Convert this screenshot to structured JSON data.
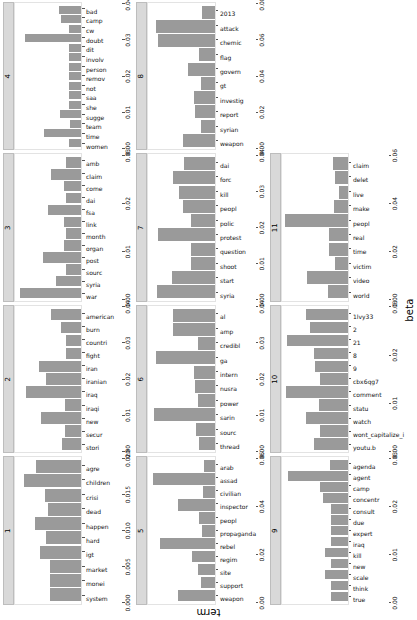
{
  "figure": {
    "xlabel": "beta",
    "ylabel": "term"
  },
  "chart_data": {
    "type": "bar",
    "title": "",
    "xlabel": "beta",
    "ylabel": "term",
    "grid": false,
    "legend": "none",
    "orientation": "horizontal",
    "note": "Faceted bar chart of LDA topic-model beta values; facets are topics 1-11 arranged in a 3-row x 4-column grid (last cell empty).",
    "facets": [
      {
        "topic": "1",
        "xlim": [
          0,
          0.02
        ],
        "ticks": [
          "0.000",
          "0.005",
          "0.010",
          "0.015",
          "0.020"
        ],
        "tick_values": [
          0.0,
          0.005,
          0.01,
          0.015,
          0.02
        ],
        "categories": [
          "system",
          "monei",
          "market",
          "igt",
          "hard",
          "happen",
          "dead",
          "crisi",
          "children",
          "agre"
        ],
        "values": [
          0.0098,
          0.0098,
          0.0099,
          0.0128,
          0.011,
          0.0145,
          0.0105,
          0.0113,
          0.0178,
          0.014
        ]
      },
      {
        "topic": "2",
        "xlim": [
          0,
          0.04
        ],
        "ticks": [
          "0.00",
          "0.01",
          "0.02",
          "0.03",
          "0.04"
        ],
        "tick_values": [
          0.0,
          0.01,
          0.02,
          0.03,
          0.04
        ],
        "categories": [
          "stori",
          "secur",
          "new",
          "iraqi",
          "iraq",
          "iranian",
          "iran",
          "fight",
          "countri",
          "burn",
          "american"
        ],
        "values": [
          0.012,
          0.01,
          0.025,
          0.0102,
          0.0345,
          0.0222,
          0.0262,
          0.0098,
          0.0098,
          0.0127,
          0.019
        ]
      },
      {
        "topic": "3",
        "xlim": [
          0,
          0.03
        ],
        "ticks": [
          "0.00",
          "0.01",
          "0.02",
          "0.03"
        ],
        "tick_values": [
          0.0,
          0.01,
          0.02,
          0.03
        ],
        "categories": [
          "war",
          "syria",
          "sourc",
          "post",
          "organ",
          "month",
          "link",
          "fsa",
          "dai",
          "come",
          "claim",
          "amb"
        ],
        "values": [
          0.0288,
          0.012,
          0.007,
          0.018,
          0.0082,
          0.0073,
          0.008,
          0.0155,
          0.0072,
          0.008,
          0.014,
          0.007
        ]
      },
      {
        "topic": "4",
        "xlim": [
          0,
          0.04
        ],
        "ticks": [
          "0.00",
          "0.01",
          "0.02",
          "0.03",
          "0.04"
        ],
        "tick_values": [
          0.0,
          0.01,
          0.02,
          0.03,
          0.04
        ],
        "categories": [
          "women",
          "time",
          "team",
          "sugge",
          "she",
          "saa",
          "not",
          "remov",
          "person",
          "involv",
          "dit",
          "doubt",
          "cw",
          "camp",
          "bad"
        ],
        "values": [
          0.0075,
          0.023,
          0.0073,
          0.013,
          0.0075,
          0.0078,
          0.0078,
          0.0078,
          0.0078,
          0.0078,
          0.0078,
          0.0352,
          0.0075,
          0.0128,
          0.014
        ]
      },
      {
        "topic": "5",
        "xlim": [
          0,
          0.06
        ],
        "ticks": [
          "0.00",
          "0.02",
          "0.04",
          "0.06"
        ],
        "tick_values": [
          0.0,
          0.02,
          0.04,
          0.06
        ],
        "categories": [
          "weapon",
          "support",
          "site",
          "regim",
          "rebel",
          "propaganda",
          "peopl",
          "inspector",
          "civilian",
          "assad",
          "arab"
        ],
        "values": [
          0.0345,
          0.0125,
          0.0155,
          0.021,
          0.0512,
          0.0118,
          0.015,
          0.034,
          0.011,
          0.0575,
          0.01
        ]
      },
      {
        "topic": "6",
        "xlim": [
          0,
          0.04
        ],
        "ticks": [
          "0.00",
          "0.01",
          "0.02",
          "0.03",
          "0.04"
        ],
        "tick_values": [
          0.0,
          0.01,
          0.02,
          0.03,
          0.04
        ],
        "categories": [
          "thread",
          "sourc",
          "sarin",
          "power",
          "nusra",
          "intern",
          "ga",
          "credibl",
          "amp",
          "al"
        ],
        "values": [
          0.01,
          0.0115,
          0.038,
          0.0105,
          0.012,
          0.013,
          0.0365,
          0.0102,
          0.0262,
          0.0262
        ]
      },
      {
        "topic": "7",
        "xlim": [
          0,
          0.04
        ],
        "ticks": [
          "0.00",
          "0.01",
          "0.02",
          "0.03",
          "0.04"
        ],
        "tick_values": [
          0.0,
          0.01,
          0.02,
          0.03,
          0.04
        ],
        "categories": [
          "syria",
          "start",
          "shoot",
          "question",
          "protest",
          "polic",
          "peopl",
          "kill",
          "forc",
          "dai"
        ],
        "values": [
          0.0358,
          0.0265,
          0.0148,
          0.0148,
          0.0352,
          0.0145,
          0.0198,
          0.0222,
          0.0262,
          0.019
        ]
      },
      {
        "topic": "8",
        "xlim": [
          0,
          0.08
        ],
        "ticks": [
          "0.00",
          "0.02",
          "0.04",
          "0.06",
          "0.08"
        ],
        "tick_values": [
          0.0,
          0.02,
          0.04,
          0.06,
          0.08
        ],
        "categories": [
          "weapon",
          "syrian",
          "report",
          "investig",
          "gt",
          "govern",
          "flag",
          "chemic",
          "attack",
          "2013"
        ],
        "values": [
          0.039,
          0.017,
          0.0245,
          0.0262,
          0.0168,
          0.033,
          0.019,
          0.071,
          0.0735,
          0.0162
        ]
      },
      {
        "topic": "9",
        "xlim": [
          0,
          0.03
        ],
        "ticks": [
          "0.00",
          "0.01",
          "0.02",
          "0.03"
        ],
        "tick_values": [
          0.0,
          0.01,
          0.02,
          0.03
        ],
        "categories": [
          "true",
          "think",
          "scale",
          "new",
          "kill",
          "iraq",
          "expert",
          "due",
          "consult",
          "concentr",
          "camp",
          "agent",
          "agenda"
        ],
        "values": [
          0.0078,
          0.0078,
          0.0105,
          0.0078,
          0.0108,
          0.0078,
          0.0078,
          0.008,
          0.008,
          0.0118,
          0.0132,
          0.0282,
          0.0082
        ]
      },
      {
        "topic": "10",
        "xlim": [
          0,
          0.03
        ],
        "ticks": [
          "0.00",
          "0.01",
          "0.02",
          "0.03"
        ],
        "tick_values": [
          0.0,
          0.01,
          0.02,
          0.03
        ],
        "categories": [
          "youtu.b",
          "wont_capitalize_i",
          "watch",
          "statu",
          "comment",
          "cbx6qg7",
          "9",
          "8",
          "21",
          "2",
          "1lvy33"
        ],
        "values": [
          0.016,
          0.013,
          0.0195,
          0.0133,
          0.029,
          0.013,
          0.0155,
          0.0158,
          0.0285,
          0.0178,
          0.0198
        ]
      },
      {
        "topic": "11",
        "xlim": [
          0,
          0.06
        ],
        "ticks": [
          "0.00",
          "0.02",
          "0.04",
          "0.06"
        ],
        "tick_values": [
          0.0,
          0.02,
          0.04,
          0.06
        ],
        "categories": [
          "world",
          "video",
          "victim",
          "time",
          "real",
          "peopl",
          "make",
          "live",
          "delet",
          "claim"
        ],
        "values": [
          0.0182,
          0.0385,
          0.0122,
          0.0178,
          0.0178,
          0.0592,
          0.0135,
          0.0082,
          0.012,
          0.014
        ]
      }
    ]
  }
}
